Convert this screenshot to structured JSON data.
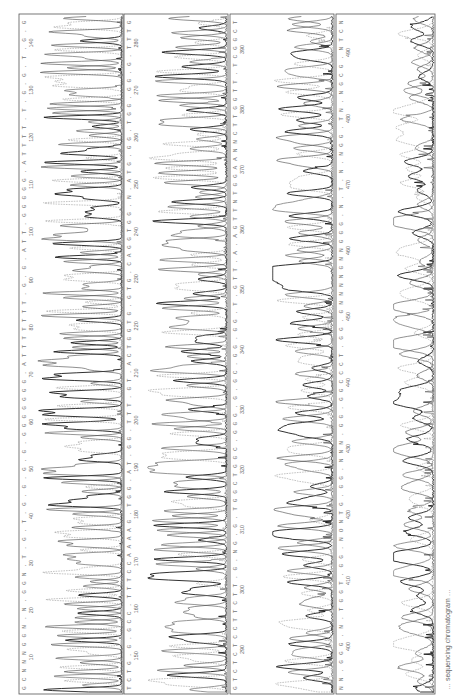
{
  "figure": {
    "orientation": "rotated-90-ccw",
    "caption": "… sequencing chromatogram …",
    "colors": {
      "trace_a": "#1a1a1a",
      "trace_b": "#6a6a6a",
      "trace_c": "#9a9a9a",
      "trace_d": "#444444",
      "frame": "#555555"
    },
    "panels": [
      {
        "id": 1,
        "x": 19,
        "width": 104,
        "top": 14,
        "bottom": 694,
        "sequence": "GCNNNGGN.N.GGN.T.G.T.G.G.G.G.GGGGGGG.ATTTTTTT.G.G.ATT.GGGGG.ATTTT.T.G.G.T.G.G",
        "positions": [
          "10",
          "20",
          "30",
          "40",
          "50",
          "60",
          "70",
          "80",
          "90",
          "100",
          "110",
          "120",
          "130",
          "140"
        ],
        "amplitude": 1.0,
        "density": 150,
        "noise": 0.15
      },
      {
        "id": 2,
        "x": 124,
        "width": 104,
        "top": 14,
        "bottom": 694,
        "sequence": "TCTG.G.GCC.TTTCCAAAAG.TGG.AT.GG.TTT.GT.ACTGGTG.GTG.CAGGTGG.N.ATG.GG.TGG.GG.G.TTTG",
        "positions": [
          "150",
          "160",
          "170",
          "180",
          "190",
          "200",
          "210",
          "220",
          "230",
          "240",
          "250",
          "260",
          "270",
          "280"
        ],
        "amplitude": 0.92,
        "density": 140,
        "noise": 0.25
      },
      {
        "id": 3,
        "x": 230,
        "width": 104,
        "top": 14,
        "bottom": 694,
        "sequence": "GTCTCTCCTTCTT.G.NG.G.TGGCTGGC.GGG.G.GC.GG.GG.T.GTT.A.AGTTNTGGAANNCTTGGTT.TCGGCT",
        "positions": [
          "290",
          "300",
          "310",
          "320",
          "330",
          "340",
          "350",
          "360",
          "370",
          "380",
          "390"
        ],
        "amplitude": 0.7,
        "density": 120,
        "noise": 0.4
      },
      {
        "id": 4,
        "x": 336,
        "width": 99,
        "top": 14,
        "bottom": 694,
        "sequence": "NN.GGG.N.TGGT.GG.NONTG.GG.NNN.GG.GGCCCT.GG.GNNNNGNNGGG.N.T.N.NGG.TN.NGCG.NTCN",
        "positions": [
          "400",
          "410",
          "420",
          "430",
          "440",
          "450",
          "460",
          "470",
          "480",
          "490"
        ],
        "amplitude": 0.5,
        "density": 95,
        "noise": 0.6
      }
    ]
  }
}
